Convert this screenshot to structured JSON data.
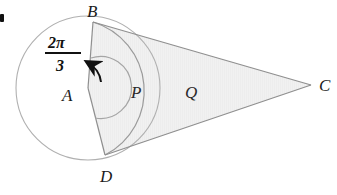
{
  "figure": {
    "type": "geometry-diagram",
    "background_color": "#ffffff",
    "shade_color": "#f0f0f0",
    "stroke_color": "#9a9a9a",
    "label_color": "#1b1b1b"
  },
  "bullet": {
    "name": "list-bullet",
    "visible": true
  },
  "points": {
    "center": {
      "label": "A",
      "x": 88,
      "y": 88
    },
    "top": {
      "label": "B",
      "x": 93,
      "y": 22
    },
    "bottom": {
      "label": "D",
      "x": 105,
      "y": 155
    },
    "apex": {
      "label": "C",
      "x": 311,
      "y": 85
    }
  },
  "point_labels": {
    "A": "A",
    "B": "B",
    "C": "C",
    "D": "D"
  },
  "regions": {
    "inner": {
      "label": "P",
      "x": 137,
      "y": 92
    },
    "outer": {
      "label": "Q",
      "x": 191,
      "y": 92
    }
  },
  "angle": {
    "vertex": "A",
    "numerator": "2π",
    "denominator": "3",
    "value_text": "2π/3",
    "marker": "arc-with-arrow"
  },
  "circle": {
    "cx": 88,
    "cy": 88,
    "r": 72
  }
}
